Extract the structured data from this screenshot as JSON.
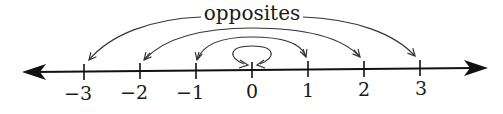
{
  "diagram": {
    "title": "opposites",
    "type": "number-line",
    "colors": {
      "ink": "#1a1a1a",
      "arc": "#333333",
      "background": "#ffffff"
    },
    "ticks": [
      {
        "value": -3,
        "label": "−3"
      },
      {
        "value": -2,
        "label": "−2"
      },
      {
        "value": -1,
        "label": "−1"
      },
      {
        "value": 0,
        "label": "0"
      },
      {
        "value": 1,
        "label": "1"
      },
      {
        "value": 2,
        "label": "2"
      },
      {
        "value": 3,
        "label": "3"
      }
    ],
    "opposite_pairs": [
      {
        "from": 0,
        "to": 0,
        "kind": "self-loop"
      },
      {
        "from": -1,
        "to": 1
      },
      {
        "from": -2,
        "to": 2
      },
      {
        "from": -3,
        "to": 3
      }
    ]
  }
}
